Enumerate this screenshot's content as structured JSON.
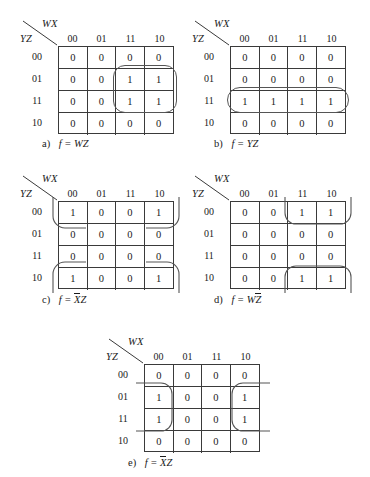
{
  "figure": {
    "type": "karnaugh-map-set",
    "col_var_label": "WX",
    "row_var_label": "YZ",
    "col_headers": [
      "00",
      "01",
      "11",
      "10"
    ],
    "row_headers": [
      "00",
      "01",
      "11",
      "10"
    ]
  },
  "maps": [
    {
      "id": "a",
      "marker": "a)",
      "caption_prefix": "f =",
      "caption_term": "WZ",
      "caption_plain": "f = WZ",
      "rows": [
        [
          "0",
          "0",
          "0",
          "0"
        ],
        [
          "0",
          "0",
          "1",
          "1"
        ],
        [
          "0",
          "0",
          "1",
          "1"
        ],
        [
          "0",
          "0",
          "0",
          "0"
        ]
      ],
      "group_note": "rounded rectangle over columns 11,10 rows 01,11"
    },
    {
      "id": "b",
      "marker": "b)",
      "caption_prefix": "f =",
      "caption_term": "YZ",
      "caption_plain": "f = YZ",
      "rows": [
        [
          "0",
          "0",
          "0",
          "0"
        ],
        [
          "0",
          "0",
          "0",
          "0"
        ],
        [
          "1",
          "1",
          "1",
          "1"
        ],
        [
          "0",
          "0",
          "0",
          "0"
        ]
      ],
      "group_note": "rounded rectangle over entire row 11"
    },
    {
      "id": "c",
      "marker": "c)",
      "caption_prefix": "f =",
      "caption_term_overbar": "X",
      "caption_term_rest": "Z",
      "caption_plain": "f = XZ",
      "rows": [
        [
          "1",
          "0",
          "0",
          "1"
        ],
        [
          "0",
          "0",
          "0",
          "0"
        ],
        [
          "0",
          "0",
          "0",
          "0"
        ],
        [
          "1",
          "0",
          "0",
          "1"
        ]
      ],
      "group_note": "four-corner wrap-around group"
    },
    {
      "id": "d",
      "marker": "d)",
      "caption_prefix": "f =",
      "caption_term_pre": "W",
      "caption_term_overbar": "Z",
      "caption_plain": "f = WZ",
      "rows": [
        [
          "0",
          "0",
          "1",
          "1"
        ],
        [
          "0",
          "0",
          "0",
          "0"
        ],
        [
          "0",
          "0",
          "0",
          "0"
        ],
        [
          "0",
          "0",
          "1",
          "1"
        ]
      ],
      "group_note": "vertical wrap-around group columns 11,10 rows 00 and 10"
    },
    {
      "id": "e",
      "marker": "e)",
      "caption_prefix": "f =",
      "caption_term_overbar": "X",
      "caption_term_rest": "Z",
      "caption_plain": "f = XZ",
      "rows": [
        [
          "0",
          "0",
          "0",
          "0"
        ],
        [
          "1",
          "0",
          "0",
          "1"
        ],
        [
          "1",
          "0",
          "0",
          "1"
        ],
        [
          "0",
          "0",
          "0",
          "0"
        ]
      ],
      "group_note": "horizontal wrap-around group columns 00 and 10 rows 01,11"
    }
  ]
}
